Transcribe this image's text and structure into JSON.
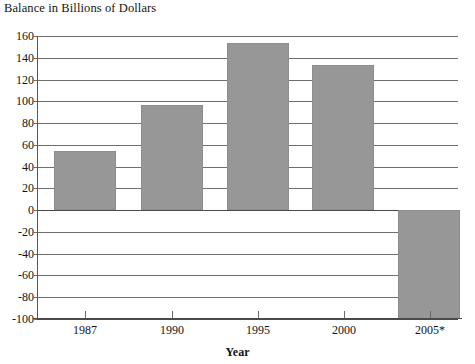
{
  "chart_data": {
    "type": "bar",
    "title": "Balance in Billions of Dollars",
    "xlabel": "Year",
    "ylabel": "",
    "categories": [
      "1987",
      "1990",
      "1995",
      "2000",
      "2005*"
    ],
    "values": [
      54,
      97,
      154,
      133,
      -100
    ],
    "ylim": [
      -100,
      160
    ],
    "ytick_labels": [
      "160",
      "140",
      "120",
      "100",
      "80",
      "60",
      "40",
      "20",
      "0",
      "-20",
      "-40",
      "-60",
      "-80",
      "-100"
    ],
    "ytick_values": [
      160,
      140,
      120,
      100,
      80,
      60,
      40,
      20,
      0,
      -20,
      -40,
      -60,
      -80,
      -100
    ],
    "grid": true,
    "legend": "none",
    "bar_color": "#979797",
    "axis_color": "#4a4a4a",
    "gridline_color": "#6f6f6f",
    "note": "2005 value is truncated at the -100 axis limit"
  }
}
